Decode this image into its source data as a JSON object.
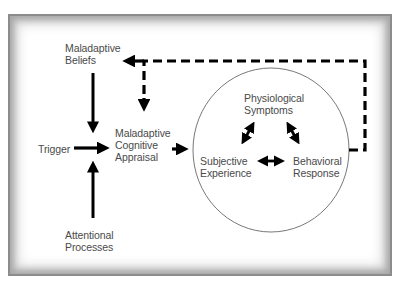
{
  "diagram": {
    "nodes": {
      "maladaptive_beliefs": "Maladaptive\nBeliefs",
      "trigger": "Trigger",
      "cognitive_appraisal": "Maladaptive\nCognitive\nAppraisal",
      "attentional_processes": "Attentional\nProcesses",
      "physiological_symptoms": "Physiological\nSymptoms",
      "subjective_experience": "Subjective\nExperience",
      "behavioral_response": "Behavioral\nResponse"
    },
    "edges": [
      {
        "from": "maladaptive_beliefs",
        "to": "cognitive_appraisal",
        "style": "solid"
      },
      {
        "from": "trigger",
        "to": "cognitive_appraisal",
        "style": "solid"
      },
      {
        "from": "attentional_processes",
        "to": "cognitive_appraisal",
        "style": "solid"
      },
      {
        "from": "cognitive_appraisal",
        "to": "response_circle",
        "style": "solid"
      },
      {
        "from": "physiological_symptoms",
        "to": "subjective_experience",
        "style": "solid",
        "bidirectional": true
      },
      {
        "from": "physiological_symptoms",
        "to": "behavioral_response",
        "style": "solid",
        "bidirectional": true
      },
      {
        "from": "subjective_experience",
        "to": "behavioral_response",
        "style": "solid",
        "bidirectional": true
      },
      {
        "from": "response_circle",
        "to": "maladaptive_beliefs",
        "style": "dashed"
      },
      {
        "from": "response_circle",
        "to": "cognitive_appraisal",
        "style": "dashed"
      }
    ],
    "colors": {
      "arrow": "#000000",
      "text": "#4a4a4a",
      "circle": "#555555",
      "frame": "#9a9a9a"
    }
  }
}
